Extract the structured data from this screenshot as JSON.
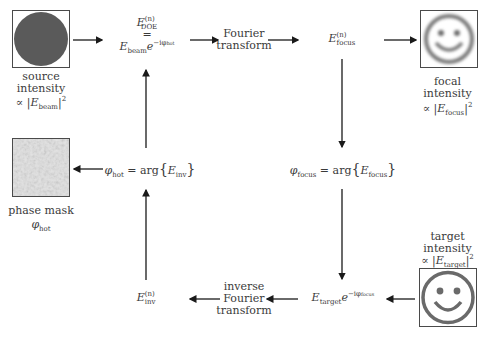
{
  "diagram": {
    "nodes": {
      "source": {
        "image": "source-beam-disc",
        "label_line1": "source",
        "label_line2": "intensity",
        "formula_prefix": "∝ |",
        "formula_E": "E",
        "formula_sub": "beam",
        "formula_suffix": "|",
        "formula_sup": "2"
      },
      "doe": {
        "E": "E",
        "sup": "(n)",
        "sub": "DOE",
        "equals": "=",
        "rhs_E": "E",
        "rhs_sub": "beam",
        "rhs_e": "e",
        "rhs_exp": "−iφ",
        "rhs_exp_sub": "hot",
        "rhs_exp_sup": "(n)"
      },
      "fourier": {
        "line1": "Fourier",
        "line2": "transform"
      },
      "focus": {
        "E": "E",
        "sup": "(n)",
        "sub": "focus"
      },
      "focal": {
        "image": "blurred-smiley",
        "label_line1": "focal",
        "label_line2": "intensity",
        "formula_prefix": "∝ |",
        "formula_E": "E",
        "formula_sub": "focus",
        "formula_sup_n": "(n)",
        "formula_suffix": "|",
        "formula_sup": "2"
      },
      "phi_focus": {
        "phi": "φ",
        "sub": "focus",
        "sup": "(n)",
        "eq": " = arg",
        "lbrace": "{",
        "E": "E",
        "E_sub": "focus",
        "E_sup": "(n)",
        "rbrace": "}"
      },
      "phi_hot": {
        "phi": "φ",
        "sub": "hot",
        "sup": "(n)",
        "eq": " = arg",
        "lbrace": "{",
        "E": "E",
        "E_sub": "inv",
        "E_sup": "(n)",
        "rbrace": "}"
      },
      "phase_mask": {
        "image": "phase-mask-noise",
        "label_line1": "phase mask",
        "phi": "φ",
        "sub": "hot",
        "sup": "(n)"
      },
      "target": {
        "image": "sharp-smiley",
        "label_line1": "target",
        "label_line2": "intensity",
        "formula_prefix": "∝ |",
        "formula_E": "E",
        "formula_sub": "target",
        "formula_suffix": "|",
        "formula_sup": "2"
      },
      "target_field": {
        "E": "E",
        "sub": "target",
        "e": "e",
        "exp": "−iφ",
        "exp_sub": "focus",
        "exp_sup": "(n)"
      },
      "inverse_fourier": {
        "line1": "inverse",
        "line2": "Fourier",
        "line3": "transform"
      },
      "inv": {
        "E": "E",
        "sup": "(n)",
        "sub": "inv"
      }
    },
    "colors": {
      "ink": "#3a3a3a",
      "arrow": "#1a1a1a",
      "disc": "#5a5a5a",
      "smiley": "#6a6a6a",
      "mask_bg": "#d9d9d9"
    }
  }
}
